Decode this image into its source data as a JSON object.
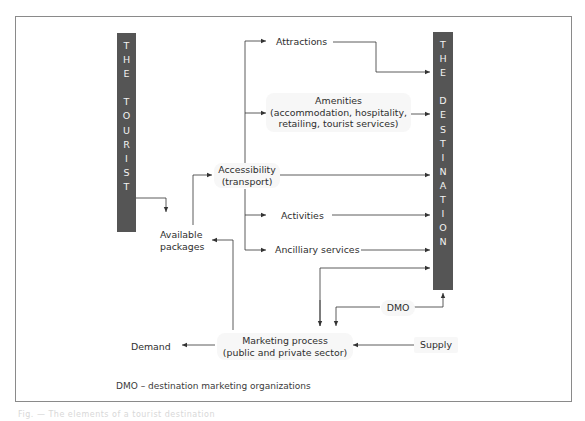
{
  "diagram": {
    "left_bar": {
      "label": "THE TOURIST",
      "letters": [
        "T",
        "H",
        "E",
        "",
        "T",
        "O",
        "U",
        "R",
        "I",
        "S",
        "T"
      ]
    },
    "right_bar": {
      "label": "THE DESTINATION",
      "letters": [
        "T",
        "H",
        "E",
        "",
        "D",
        "E",
        "S",
        "T",
        "I",
        "N",
        "A",
        "T",
        "I",
        "O",
        "N"
      ]
    },
    "nodes": {
      "attractions": "Attractions",
      "amenities_title": "Amenities",
      "amenities_line2": "(accommodation, hospitality,",
      "amenities_line3": "retailing, tourist services)",
      "accessibility_line1": "Accessibility",
      "accessibility_line2": "(transport)",
      "activities": "Activities",
      "ancillary": "Ancilliary services",
      "available_line1": "Available",
      "available_line2": "packages",
      "dmo": "DMO",
      "marketing_line1": "Marketing process",
      "marketing_line2": "(public and private sector)",
      "demand": "Demand",
      "supply": "Supply"
    },
    "footnote": "DMO – destination marketing organizations",
    "caption": "Fig. — The elements of a tourist destination",
    "colors": {
      "bar": "#555555",
      "bar_text": "#f2f2f2",
      "line": "#333333",
      "frame": "#8a8a8a"
    }
  }
}
